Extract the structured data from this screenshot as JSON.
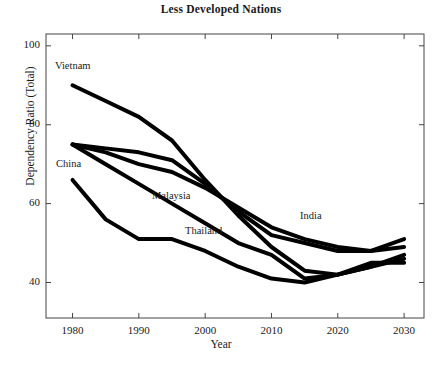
{
  "chart_data": {
    "type": "line",
    "title": "Less Developed Nations",
    "xlabel": "Year",
    "ylabel": "Dependency Ratio (Total)",
    "xlim": [
      1976,
      2033
    ],
    "ylim": [
      31,
      103
    ],
    "xticks": [
      1980,
      1990,
      2000,
      2010,
      2020,
      2030
    ],
    "yticks": [
      40,
      60,
      80,
      100
    ],
    "grid": false,
    "legend_position": "inline-labels",
    "line_color": "#000000",
    "line_width": 4,
    "x": [
      1980,
      1985,
      1990,
      1995,
      2000,
      2005,
      2010,
      2015,
      2020,
      2025,
      2030
    ],
    "series": [
      {
        "name": "Vietnam",
        "values": [
          90,
          86,
          82,
          76,
          66,
          57,
          49,
          43,
          42,
          44,
          46
        ],
        "label_x": 55,
        "label_y": 60
      },
      {
        "name": "China",
        "values": [
          66,
          56,
          51,
          51,
          48,
          44,
          41,
          40,
          42,
          44,
          47
        ],
        "label_x": 56,
        "label_y": 158
      },
      {
        "name": "Malaysia",
        "values": [
          75,
          74,
          73,
          71,
          65,
          58,
          52,
          50,
          48,
          48,
          49
        ],
        "label_x": 152,
        "label_y": 190
      },
      {
        "name": "Thailand",
        "values": [
          75,
          70,
          65,
          60,
          55,
          50,
          47,
          41,
          42,
          45,
          45
        ],
        "label_x": 185,
        "label_y": 225
      },
      {
        "name": "India",
        "values": [
          75,
          73,
          70,
          68,
          64,
          59,
          54,
          51,
          49,
          48,
          51
        ],
        "label_x": 300,
        "label_y": 210
      }
    ]
  },
  "axis": {
    "x_tick_labels": [
      "1980",
      "1990",
      "2000",
      "2010",
      "2020",
      "2030"
    ],
    "y_tick_labels": [
      "40",
      "60",
      "80",
      "100"
    ]
  }
}
